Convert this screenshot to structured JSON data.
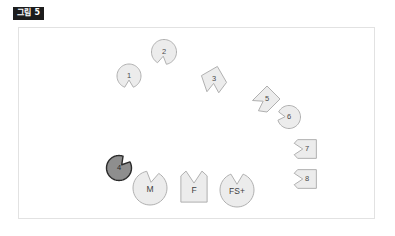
{
  "figure": {
    "label": "그림 5",
    "caption_badge_color": "#1c1c1c",
    "canvas_background": "#ffffff",
    "canvas_border_color": "#e2e2e2"
  },
  "colors": {
    "piece_fill": "#ececec",
    "piece_stroke": "#a8a8a8",
    "accent_fill": "#8e8e8e",
    "accent_stroke": "#2b2b2b",
    "label_text": "#4b4b4b"
  },
  "diagram": {
    "type": "arc-of-notched-shapes",
    "arc_pieces": [
      {
        "id": "piece-1",
        "label": "1",
        "form": "circle-notch-bottom",
        "cx": 110,
        "cy": 48,
        "r": 12,
        "notch_angle_deg": 90,
        "highlighted": false
      },
      {
        "id": "piece-2",
        "label": "2",
        "form": "circle-notch-bottom",
        "cx": 145,
        "cy": 24,
        "r": 12.5,
        "notch_angle_deg": 100,
        "highlighted": false
      },
      {
        "id": "piece-3",
        "label": "3",
        "form": "square-notch-bottom-tilted",
        "cx": 195,
        "cy": 51,
        "r": 13,
        "notch_angle_deg": 95,
        "highlighted": false
      },
      {
        "id": "piece-5",
        "label": "5",
        "form": "diamond-notch-bottom-left",
        "cx": 248,
        "cy": 71,
        "r": 13,
        "notch_angle_deg": 150,
        "highlighted": false
      },
      {
        "id": "piece-6",
        "label": "6",
        "form": "circle-notch-left",
        "cx": 270,
        "cy": 89,
        "r": 11.5,
        "notch_angle_deg": 185,
        "highlighted": false
      },
      {
        "id": "piece-7",
        "label": "7",
        "form": "square-notch-left",
        "cx": 288,
        "cy": 121,
        "r": 12.5,
        "notch_angle_deg": 180,
        "highlighted": false
      },
      {
        "id": "piece-8",
        "label": "8",
        "form": "square-notch-left",
        "cx": 288,
        "cy": 151,
        "r": 12.5,
        "notch_angle_deg": 180,
        "highlighted": false
      }
    ],
    "accent_piece": {
      "id": "piece-4",
      "label": "4",
      "form": "circle-notch-top-right",
      "cx": 100,
      "cy": 140,
      "r": 12.5,
      "notch_angle_deg": -50,
      "highlighted": true
    },
    "bottom_pieces": [
      {
        "id": "piece-m",
        "label": "M",
        "form": "circle-notch-top",
        "cx": 131,
        "cy": 160,
        "r": 17,
        "notch_angle_deg": -80
      },
      {
        "id": "piece-f",
        "label": "F",
        "form": "square-notch-top",
        "cx": 175,
        "cy": 161,
        "r": 17.5,
        "notch_angle_deg": -90
      },
      {
        "id": "piece-fsp",
        "label": "FS+",
        "form": "circle-notch-top",
        "cx": 218,
        "cy": 162,
        "r": 17,
        "notch_angle_deg": -90
      }
    ]
  }
}
